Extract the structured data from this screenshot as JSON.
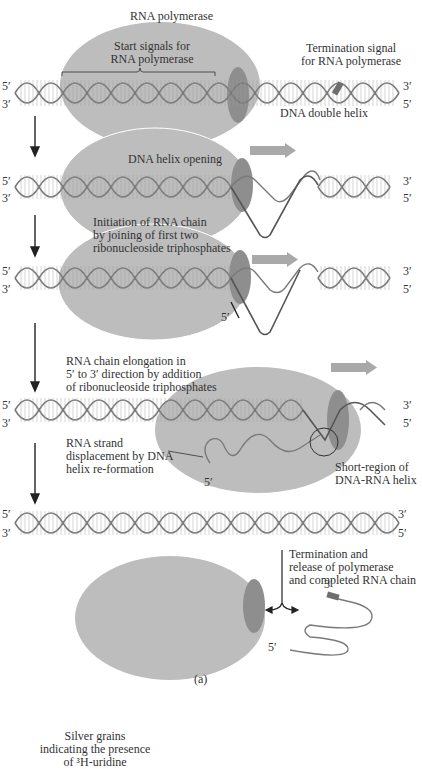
{
  "figure": {
    "caption": "(a)",
    "stage1": {
      "polymerase_label": "RNA polymerase",
      "start_signals_line1": "Start signals for",
      "start_signals_line2": "RNA polymerase",
      "termination_line1": "Termination signal",
      "termination_line2": "for RNA polymerase",
      "dna_label": "DNA double helix",
      "left_top": "5′",
      "left_bottom": "3′",
      "right_top": "3′",
      "right_bottom": "5′"
    },
    "stage2": {
      "label": "DNA helix opening",
      "left_top": "5′",
      "left_bottom": "3′",
      "right_top": "3′",
      "right_bottom": "5′"
    },
    "stage3": {
      "label_line1": "Initiation of RNA chain",
      "label_line2": "by joining of first two",
      "label_line3": "ribonucleoside triphosphates",
      "rna_end": "5′",
      "left_top": "5′",
      "left_bottom": "3′",
      "right_top": "3′",
      "right_bottom": "5′"
    },
    "stage4": {
      "label_line1": "RNA chain elongation in",
      "label_line2": "5′ to 3′ direction by addition",
      "label_line3": "of ribonucleoside triphosphates",
      "displacement_line1": "RNA strand",
      "displacement_line2": "displacement by DNA",
      "displacement_line3": "helix re-formation",
      "hybrid_line1": "Short-region of",
      "hybrid_line2": "DNA-RNA helix",
      "rna_end": "5′",
      "left_top": "5′",
      "left_bottom": "3′",
      "right_top": "3′",
      "right_bottom": "5′"
    },
    "stage5": {
      "left_top": "5′",
      "left_bottom": "3′",
      "right_top": "3′",
      "right_bottom": "5′",
      "release_line1": "Termination and",
      "release_line2": "release of polymerase",
      "release_line3": "and completed RNA chain",
      "rna_3_end": "3′",
      "rna_5_end": "5′"
    },
    "next_figure": {
      "line1": "Silver grains",
      "line2": "indicating the presence",
      "line3": "of ³H-uridine"
    }
  },
  "colors": {
    "polymerase": "#b8b8b8",
    "polymerase_dark": "#8f8f8f",
    "strand": "#7a7a7a",
    "rung": "#9a9a9a",
    "arrow": "#a9a9a9",
    "termination_signal": "#6e6e6e"
  }
}
